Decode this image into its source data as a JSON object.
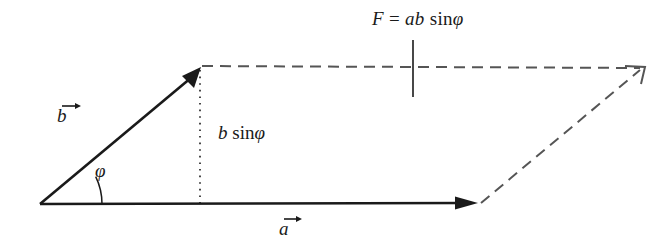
{
  "figure": {
    "background_color": "#ffffff",
    "stroke_color": "#1a1a1a",
    "dashed_color": "#555555",
    "labels": {
      "force_F": "F",
      "force_equals": " = ",
      "force_ab": "ab",
      "force_sin": " sin",
      "force_phi": "φ",
      "height_b": "b",
      "height_sin": " sin",
      "height_phi": "φ",
      "angle_phi": "φ",
      "vector_b": "b",
      "vector_a": "a"
    },
    "annotations": {
      "force_expression": "F = ab sinφ",
      "height_expression": "b sinφ",
      "angle_symbol": "φ",
      "vector_a_symbol": "a",
      "vector_b_symbol": "b"
    },
    "geometry": {
      "origin_x": 40,
      "origin_y": 204,
      "vector_a_tip_x": 478,
      "vector_a_tip_y": 203,
      "vector_b_tip_x": 201,
      "vector_b_tip_y": 67,
      "parallelogram_far_x": 645,
      "parallelogram_far_y": 68,
      "height_foot_x": 200,
      "height_foot_y": 204,
      "tick_line_x": 413,
      "tick_line_top_y": 40,
      "tick_line_bottom_y": 97,
      "angle_arc_radius": 62,
      "angle_degrees": 26
    }
  }
}
